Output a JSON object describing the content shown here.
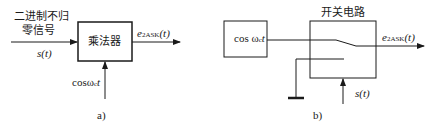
{
  "diagram_a": {
    "input_label_line1": "二进制不归",
    "input_label_line2": "零信号",
    "input_signal": "s(t)",
    "block_label": "乘法器",
    "output_signal_main": "e",
    "output_signal_sub": "2ASK",
    "output_signal_tail": "(t)",
    "carrier_input": "cosω",
    "carrier_sub": "c",
    "carrier_tail": "t",
    "caption": "a)"
  },
  "diagram_b": {
    "source_block_label": "cos ω",
    "source_block_sub": "c",
    "source_block_tail": "t",
    "switch_block_title": "开关电路",
    "output_signal_main": "e",
    "output_signal_sub": "2ASK",
    "output_signal_tail": "(t)",
    "control_signal": "s(t)",
    "caption": "b)"
  },
  "colors": {
    "line": "#1a1a1a",
    "background": "#ffffff"
  }
}
